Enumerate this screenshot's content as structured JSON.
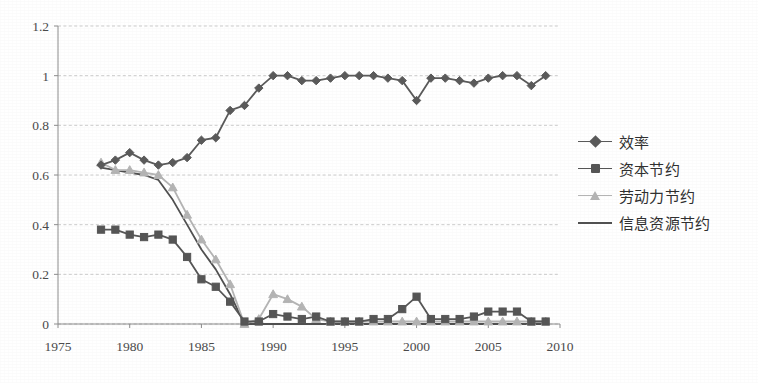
{
  "chart_data": {
    "type": "line",
    "title": "",
    "subtitle": "",
    "xlabel": "",
    "ylabel": "",
    "xlim": [
      1975,
      2010
    ],
    "ylim": [
      0,
      1.2
    ],
    "ytick_labels": [
      "0",
      "0.2",
      "0.4",
      "0.6",
      "0.8",
      "1",
      "1.2"
    ],
    "ytick_values": [
      0,
      0.2,
      0.4,
      0.6,
      0.8,
      1,
      1.2
    ],
    "xtick_labels": [
      "1975",
      "1980",
      "1985",
      "1990",
      "1995",
      "2000",
      "2005",
      "2010"
    ],
    "xtick_values": [
      1975,
      1980,
      1985,
      1990,
      1995,
      2000,
      2005,
      2010
    ],
    "grid": "horizontal-dashed",
    "legend_position": "right",
    "x": [
      1978,
      1979,
      1980,
      1981,
      1982,
      1983,
      1984,
      1985,
      1986,
      1987,
      1988,
      1989,
      1990,
      1991,
      1992,
      1993,
      1994,
      1995,
      1996,
      1997,
      1998,
      1999,
      2000,
      2001,
      2002,
      2003,
      2004,
      2005,
      2006,
      2007,
      2008,
      2009
    ],
    "series": [
      {
        "name": "效率",
        "marker": "diamond",
        "color": "#595959",
        "values": [
          0.64,
          0.66,
          0.69,
          0.66,
          0.64,
          0.65,
          0.67,
          0.74,
          0.75,
          0.86,
          0.88,
          0.95,
          1.0,
          1.0,
          0.98,
          0.98,
          0.99,
          1.0,
          1.0,
          1.0,
          0.99,
          0.98,
          0.9,
          0.99,
          0.99,
          0.98,
          0.97,
          0.99,
          1.0,
          1.0,
          0.96,
          1.0
        ]
      },
      {
        "name": "资本节约",
        "marker": "square",
        "color": "#555555",
        "values": [
          0.38,
          0.38,
          0.36,
          0.35,
          0.36,
          0.34,
          0.27,
          0.18,
          0.15,
          0.09,
          0.01,
          0.01,
          0.04,
          0.03,
          0.02,
          0.03,
          0.01,
          0.01,
          0.01,
          0.02,
          0.02,
          0.06,
          0.11,
          0.02,
          0.02,
          0.02,
          0.03,
          0.05,
          0.05,
          0.05,
          0.01,
          0.01
        ]
      },
      {
        "name": "劳动力节约",
        "marker": "triangle",
        "color": "#b4b4b4",
        "values": [
          0.65,
          0.62,
          0.62,
          0.61,
          0.6,
          0.55,
          0.44,
          0.34,
          0.26,
          0.16,
          0.0,
          0.02,
          0.12,
          0.1,
          0.07,
          0.02,
          0.01,
          0.01,
          0.01,
          0.01,
          0.01,
          0.01,
          0.01,
          0.01,
          0.01,
          0.01,
          0.01,
          0.01,
          0.01,
          0.01,
          0.01,
          0.01
        ]
      },
      {
        "name": "信息资源节约",
        "marker": "none",
        "color": "#4f4f4f",
        "values": [
          0.63,
          0.62,
          0.61,
          0.6,
          0.58,
          0.5,
          0.4,
          0.3,
          0.22,
          0.12,
          0.0,
          0.0,
          0.0,
          0.0,
          0.0,
          0.0,
          0.0,
          0.0,
          0.0,
          0.0,
          0.0,
          0.0,
          0.0,
          0.0,
          0.0,
          0.0,
          0.0,
          0.0,
          0.0,
          0.0,
          0.0,
          0.0
        ]
      }
    ]
  },
  "legend": {
    "items": [
      {
        "label": "效率"
      },
      {
        "label": "资本节约"
      },
      {
        "label": "劳动力节约"
      },
      {
        "label": "信息资源节约"
      }
    ]
  },
  "colors": {
    "axis": "#8c8c8c",
    "grid": "#b9b9b9",
    "background": "#ffffff"
  }
}
